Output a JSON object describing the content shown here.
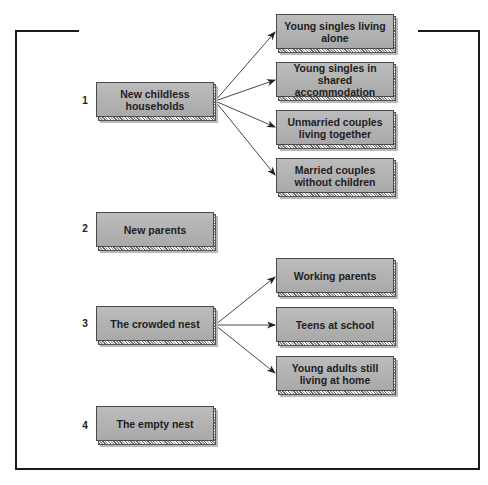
{
  "diagram": {
    "stages": [
      {
        "number": "1",
        "label": "New childless households",
        "children": [
          "Young singles living alone",
          "Young singles in shared accommodation",
          "Unmarried couples living together",
          "Married couples without children"
        ]
      },
      {
        "number": "2",
        "label": "New parents",
        "children": []
      },
      {
        "number": "3",
        "label": "The crowded nest",
        "children": [
          "Working parents",
          "Teens at school",
          "Young adults still living at home"
        ]
      },
      {
        "number": "4",
        "label": "The empty nest",
        "children": []
      }
    ],
    "colors": {
      "box_fill": "#b3b3b3",
      "box_border": "#4a4a4a",
      "shadow": "#b9b9b9",
      "arrow": "#333333",
      "frame": "#1a1a1a"
    }
  }
}
